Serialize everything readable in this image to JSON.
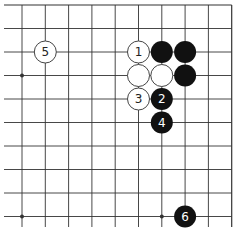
{
  "board": {
    "board_size": 19,
    "view": "top-right quadrant",
    "visible_columns": 10,
    "visible_rows": 10,
    "edges": {
      "top": true,
      "right": true,
      "left": false,
      "bottom": false
    },
    "colors": {
      "background": "#ffffff",
      "line": "#333333",
      "black_stone": "#111111",
      "white_stone": "#ffffff",
      "white_stone_border": "#444444",
      "black_label": "#ffffff",
      "white_label": "#222222"
    },
    "hoshi": [
      {
        "col": 0,
        "row": 3
      },
      {
        "col": 6,
        "row": 3
      },
      {
        "col": 0,
        "row": 9
      },
      {
        "col": 6,
        "row": 9
      }
    ],
    "stones": [
      {
        "color": "white",
        "col": 1,
        "row": 2,
        "label": "5"
      },
      {
        "color": "white",
        "col": 5,
        "row": 2,
        "label": "1"
      },
      {
        "color": "black",
        "col": 6,
        "row": 2,
        "label": ""
      },
      {
        "color": "black",
        "col": 7,
        "row": 2,
        "label": ""
      },
      {
        "color": "white",
        "col": 5,
        "row": 3,
        "label": ""
      },
      {
        "color": "white",
        "col": 6,
        "row": 3,
        "label": ""
      },
      {
        "color": "black",
        "col": 7,
        "row": 3,
        "label": ""
      },
      {
        "color": "white",
        "col": 5,
        "row": 4,
        "label": "3"
      },
      {
        "color": "black",
        "col": 6,
        "row": 4,
        "label": "2"
      },
      {
        "color": "black",
        "col": 6,
        "row": 5,
        "label": "4"
      },
      {
        "color": "black",
        "col": 7,
        "row": 9,
        "label": "6"
      }
    ]
  }
}
